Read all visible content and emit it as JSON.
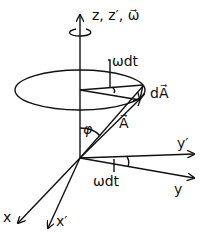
{
  "diagram": {
    "labels": {
      "z_axis": "z, z′, ω⃗",
      "omega_dt_top": "ωdt",
      "dA": "dA⃗",
      "phi": "φ",
      "A": "A⃗",
      "y_prime": "y′",
      "omega_dt_bottom": "ωdt",
      "y": "y",
      "x": "x",
      "x_prime": "x′"
    },
    "colors": {
      "stroke": "#111111",
      "background": "#ffffff"
    }
  }
}
